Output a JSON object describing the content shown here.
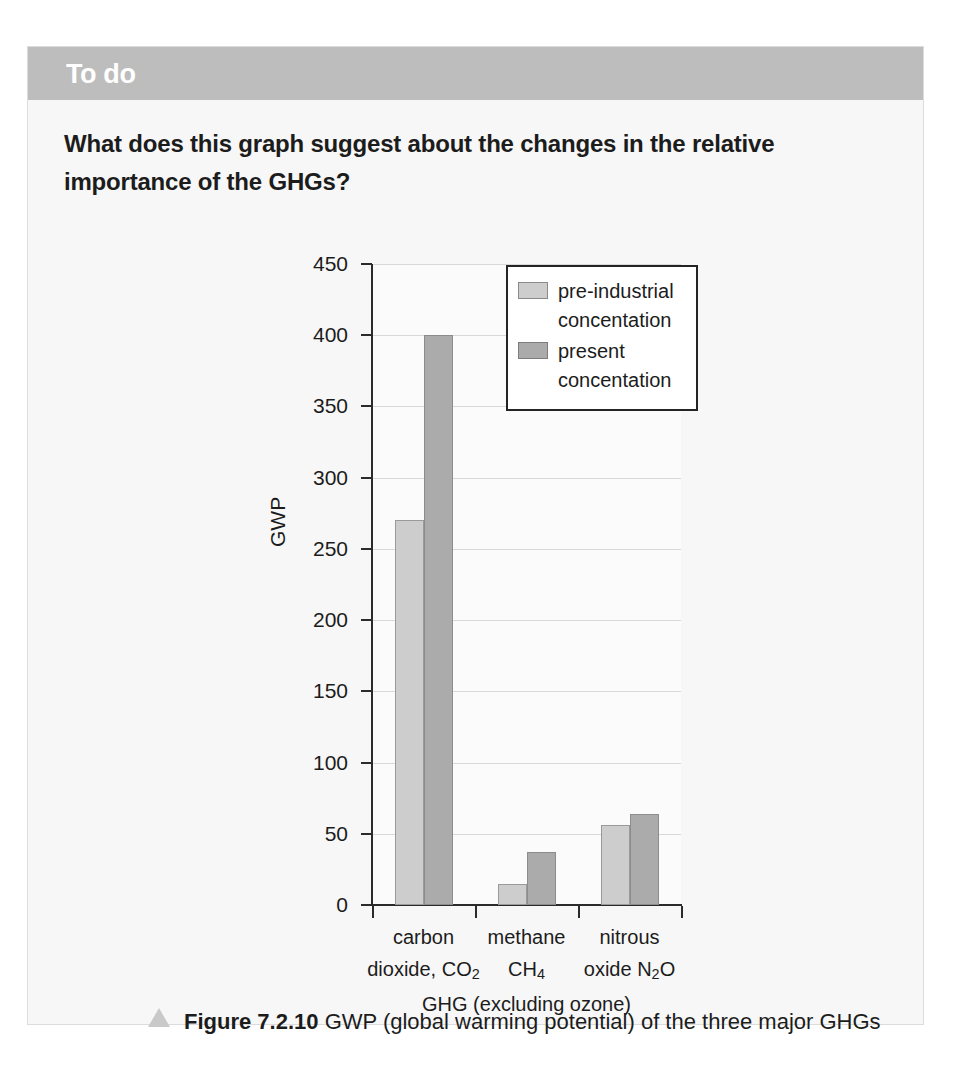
{
  "card": {
    "header_title": "To do",
    "question": "What does this graph suggest about the changes in the relative importance of the GHGs?"
  },
  "caption": {
    "figure_number": "Figure 7.2.10",
    "figure_text": " GWP (global warming potential) of the three major GHGs"
  },
  "chart_data": {
    "type": "bar",
    "title": "",
    "xlabel": "GHG (excluding ozone)",
    "ylabel": "GWP",
    "ylim": [
      0,
      450
    ],
    "ytick_values": [
      0,
      50,
      100,
      150,
      200,
      250,
      300,
      350,
      400,
      450
    ],
    "ytick_labels": [
      "0",
      "50",
      "100",
      "150",
      "200",
      "250",
      "300",
      "350",
      "400",
      "450"
    ],
    "grid": true,
    "legend_position": "upper-center",
    "categories": [
      "carbon dioxide, CO2",
      "methane CH4",
      "nitrous oxide N2O"
    ],
    "category_lines": [
      [
        "carbon",
        "dioxide, CO",
        "2"
      ],
      [
        "methane",
        "CH",
        "4"
      ],
      [
        "nitrous",
        "oxide N",
        "2",
        "O"
      ]
    ],
    "series": [
      {
        "name": "pre-industrial concentation",
        "name_line1": "pre-industrial",
        "name_line2": "concentation",
        "color": "#cdcdcd",
        "values": [
          270,
          15,
          56
        ]
      },
      {
        "name": "present concentation",
        "name_line1": "present",
        "name_line2": "concentation",
        "color": "#ababab",
        "values": [
          400,
          37,
          64
        ]
      }
    ]
  }
}
